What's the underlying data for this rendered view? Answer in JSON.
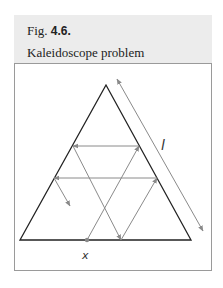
{
  "figure": {
    "number_prefix": "Fig.",
    "number": "4.6.",
    "title": "Kaleidoscope problem"
  },
  "diagram": {
    "labels": {
      "side_length": "l",
      "start_point": "x"
    },
    "colors": {
      "triangle": "#222222",
      "path": "#8a8a8a",
      "background": "#ececec"
    },
    "triangle": {
      "apex": [
        106,
        85
      ],
      "base_left": [
        20,
        240
      ],
      "base_right": [
        191,
        240
      ]
    },
    "path_points": [
      [
        87,
        240
      ],
      [
        139,
        146
      ],
      [
        73,
        146
      ],
      [
        121,
        240
      ],
      [
        157,
        178
      ],
      [
        54,
        178
      ],
      [
        70,
        206
      ]
    ]
  }
}
